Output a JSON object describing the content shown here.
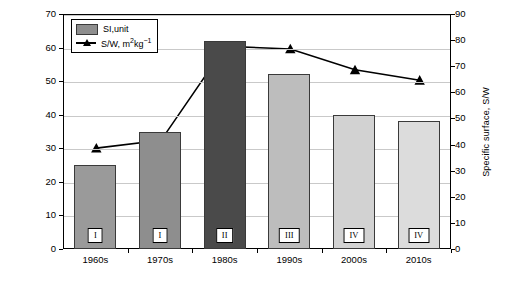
{
  "chart_data": {
    "type": "bar",
    "title": "",
    "categories": [
      "1960s",
      "1970s",
      "1980s",
      "1990s",
      "2000s",
      "2010s"
    ],
    "series": [
      {
        "name": "SI,unit",
        "type": "bar",
        "axis": "left",
        "values": [
          25,
          35,
          62,
          52,
          40,
          38
        ],
        "point_labels": [
          "I",
          "I",
          "II",
          "III",
          "IV",
          "IV"
        ],
        "colors": [
          "#9a9a9a",
          "#8e8e8e",
          "#4a4a4a",
          "#bdbdbd",
          "#d2d2d2",
          "#dcdcdc"
        ]
      },
      {
        "name": "S/W, m2kg-1",
        "type": "line",
        "axis": "right",
        "values": [
          39,
          42,
          78,
          77,
          69,
          65
        ],
        "marker": "triangle",
        "color": "#000000"
      }
    ],
    "xlabel": "",
    "ylabel": "Surface index, SI",
    "ylabel_right": "Specific surface, S/W",
    "ylim": [
      0,
      70
    ],
    "yticks": [
      0,
      10,
      20,
      30,
      40,
      50,
      60,
      70
    ],
    "ylim_right": [
      0,
      90
    ],
    "yticks_right": [
      0,
      10,
      20,
      30,
      40,
      50,
      60,
      70,
      80,
      90
    ],
    "grid": true,
    "legend_position": "top-left"
  },
  "legend": {
    "bar_label": "SI,unit",
    "line_label_prefix": "S/W, m",
    "line_label_sup1": "2",
    "line_label_mid": "kg",
    "line_label_sup2": "−1"
  }
}
